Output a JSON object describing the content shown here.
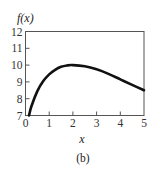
{
  "chart_data": {
    "type": "line",
    "title": "",
    "ylabel": "f(x)",
    "xlabel": "x",
    "caption": "(b)",
    "xlim": [
      0,
      5
    ],
    "ylim": [
      7,
      12
    ],
    "x_ticks": [
      "0",
      "1",
      "2",
      "3",
      "4",
      "5"
    ],
    "y_ticks": [
      "7",
      "8",
      "9",
      "10",
      "11",
      "12"
    ],
    "grid": false,
    "legend": null,
    "series": [
      {
        "name": "f(x)",
        "x": [
          0.15,
          0.25,
          0.5,
          0.75,
          1.0,
          1.25,
          1.5,
          1.75,
          2.0,
          2.5,
          3.0,
          3.5,
          4.0,
          4.5,
          5.0
        ],
        "y": [
          7.0,
          7.55,
          8.45,
          9.05,
          9.45,
          9.72,
          9.9,
          9.98,
          10.0,
          9.93,
          9.75,
          9.48,
          9.15,
          8.82,
          8.5
        ]
      }
    ],
    "color": "#111111"
  }
}
